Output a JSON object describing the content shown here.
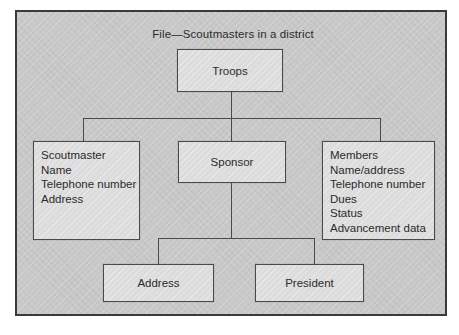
{
  "diagram": {
    "title": "File—Scoutmasters in a district",
    "type": "hierarchy-tree",
    "colors": {
      "panel_background": "#c8c8c8",
      "panel_border": "#3a3a3a",
      "node_fill": "#dcdcdc",
      "node_border": "#4a4a4a",
      "text": "#2b2b2b",
      "connector": "#4a4a4a"
    },
    "nodes": {
      "root": {
        "id": "troops",
        "label": "Troops",
        "fields": []
      },
      "scoutmaster": {
        "id": "scoutmaster",
        "label": "Scoutmaster",
        "fields": [
          "Scoutmaster",
          "Name",
          "Telephone number",
          "Address"
        ]
      },
      "sponsor": {
        "id": "sponsor",
        "label": "Sponsor",
        "fields": []
      },
      "members": {
        "id": "members",
        "label": "Members",
        "fields": [
          "Members",
          "Name/address",
          "Telephone number",
          "Dues",
          "Status",
          "Advancement data"
        ]
      },
      "address": {
        "id": "address",
        "label": "Address",
        "fields": []
      },
      "president": {
        "id": "president",
        "label": "President",
        "fields": []
      }
    },
    "edges": [
      {
        "from": "troops",
        "to": "scoutmaster"
      },
      {
        "from": "troops",
        "to": "sponsor"
      },
      {
        "from": "troops",
        "to": "members"
      },
      {
        "from": "sponsor",
        "to": "address"
      },
      {
        "from": "sponsor",
        "to": "president"
      }
    ]
  }
}
